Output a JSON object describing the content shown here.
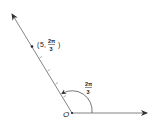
{
  "diagram": {
    "type": "polar-coordinate",
    "origin_label": "O",
    "point_label": {
      "open": "(",
      "r": "5,",
      "theta_num": "2π",
      "theta_den": "3",
      "close": ")"
    },
    "angle_label": {
      "num": "2π",
      "den": "3"
    },
    "tick_count": 5,
    "colors": {
      "line": "#555555",
      "text": "#222222"
    }
  }
}
